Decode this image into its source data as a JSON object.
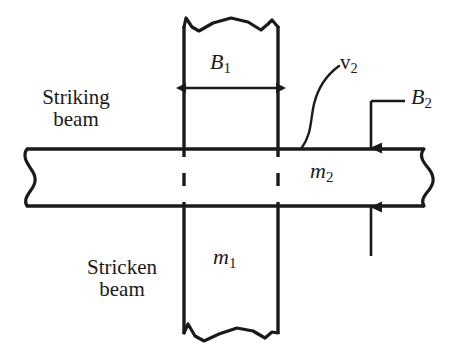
{
  "figure": {
    "type": "engineering-diagram",
    "stroke_color": "#1a1a1a",
    "background_color": "#ffffff"
  },
  "labels": {
    "striking_beam_line1": "Striking",
    "striking_beam_line2": "beam",
    "stricken_beam_line1": "Stricken",
    "stricken_beam_line2": "beam",
    "b1_symbol": "B",
    "b1_subscript": "1",
    "b2_symbol": "B",
    "b2_subscript": "2",
    "v2_symbol": "v",
    "v2_subscript": "2",
    "m1_symbol": "m",
    "m1_subscript": "1",
    "m2_symbol": "m",
    "m2_subscript": "2"
  },
  "geometry": {
    "vertical_beam_left_x": 183,
    "vertical_beam_right_x": 279,
    "vertical_beam_top_y": 22,
    "vertical_beam_bottom_y": 337,
    "horizontal_beam_top_y": 148,
    "horizontal_beam_bottom_y": 207,
    "horizontal_beam_left_x": 26,
    "horizontal_beam_right_x": 424,
    "b1_arrow_y": 88,
    "b2_arrow_x": 371,
    "b2_leader_top_y": 102,
    "b2_tail_bottom_y": 256
  }
}
